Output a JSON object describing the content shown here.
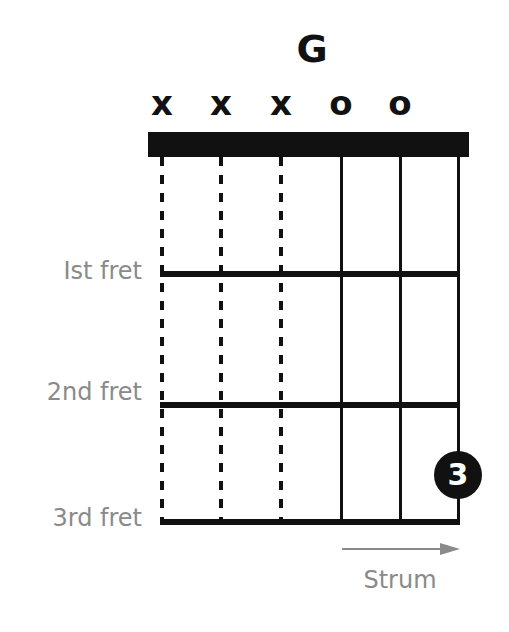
{
  "chord": {
    "name": "G",
    "string_markers": [
      "x",
      "x",
      "x",
      "o",
      "o",
      ""
    ],
    "muted_strings": [
      1,
      2,
      3
    ],
    "open_strings": [
      4,
      5
    ],
    "fingering": [
      {
        "string": 6,
        "fret": 3,
        "finger_label": "3"
      }
    ]
  },
  "fret_labels": [
    "Ist fret",
    "2nd fret",
    "3rd fret"
  ],
  "strum": {
    "label": "Strum",
    "direction": "right"
  },
  "colors": {
    "ink": "#111111",
    "label_gray": "#8a8a8a",
    "background": "#ffffff"
  }
}
